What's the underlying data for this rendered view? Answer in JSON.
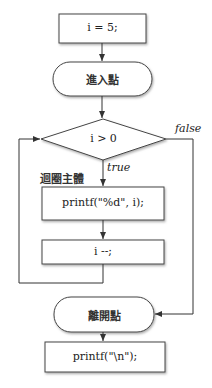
{
  "diagram": {
    "type": "flowchart",
    "nodes": [
      {
        "id": "init",
        "shape": "process",
        "label": "i = 5;"
      },
      {
        "id": "entry",
        "shape": "terminal",
        "label": "進入點"
      },
      {
        "id": "cond",
        "shape": "decision",
        "label": "i > 0"
      },
      {
        "id": "body1",
        "shape": "process",
        "label": "printf(\"%d\", i);"
      },
      {
        "id": "body2",
        "shape": "process",
        "label": "i --;"
      },
      {
        "id": "exit",
        "shape": "terminal",
        "label": "離開點"
      },
      {
        "id": "after",
        "shape": "process",
        "label": "printf(\"\\n\");"
      }
    ],
    "annotations": {
      "loop_body": "迴圈主體",
      "true_label": "true",
      "false_label": "false"
    },
    "edges": [
      {
        "from": "init",
        "to": "entry"
      },
      {
        "from": "entry",
        "to": "cond"
      },
      {
        "from": "cond",
        "to": "body1",
        "label": "true"
      },
      {
        "from": "body1",
        "to": "body2"
      },
      {
        "from": "body2",
        "to": "cond",
        "label": "loop back"
      },
      {
        "from": "cond",
        "to": "exit",
        "label": "false"
      },
      {
        "from": "exit",
        "to": "after"
      }
    ]
  }
}
